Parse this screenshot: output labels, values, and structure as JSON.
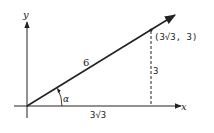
{
  "diagram": {
    "axes": {
      "x_label": "x",
      "y_label": "y"
    },
    "vector": {
      "length_label": "6"
    },
    "angle": {
      "label": "α"
    },
    "point": {
      "label": "(3√3, 3)"
    },
    "legs": {
      "horizontal_label": "3√3",
      "vertical_label": "3"
    },
    "colors": {
      "stroke": "#222222",
      "background": "#ffffff"
    }
  }
}
